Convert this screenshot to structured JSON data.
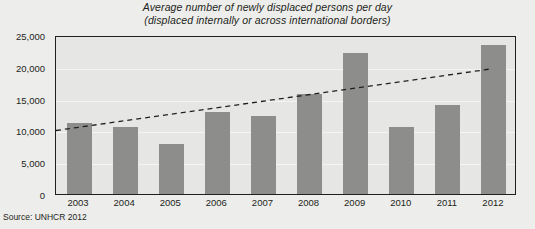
{
  "title": {
    "line1": "Average number of newly displaced persons per day",
    "line2": "(displaced internally or across international borders)"
  },
  "source": "Source: UNHCR 2012",
  "colors": {
    "bar": "#8d8d8c",
    "plot_background": "#e6e6e4",
    "page_background": "#ededeb",
    "axis": "#231f20",
    "gridline": "#f4f4f2",
    "trendline": "#231f20"
  },
  "chart_data": {
    "type": "bar",
    "title": "Average number of newly displaced persons per day (displaced internally or across international borders)",
    "xlabel": "",
    "ylabel": "",
    "categories": [
      "2003",
      "2004",
      "2005",
      "2006",
      "2007",
      "2008",
      "2009",
      "2010",
      "2011",
      "2012"
    ],
    "values": [
      11200,
      10500,
      7900,
      12900,
      12300,
      15800,
      22200,
      10600,
      14000,
      23400
    ],
    "ylim": [
      0,
      25000
    ],
    "ytick_labels": [
      "0",
      "5,000",
      "10,000",
      "15,000",
      "20,000",
      "25,000"
    ],
    "ytick_values": [
      0,
      5000,
      10000,
      15000,
      20000,
      25000
    ],
    "grid": true,
    "legend": "none",
    "annotations": [
      {
        "type": "trendline",
        "style": "dashed",
        "start_value": 10300,
        "end_value": 20000
      }
    ]
  }
}
